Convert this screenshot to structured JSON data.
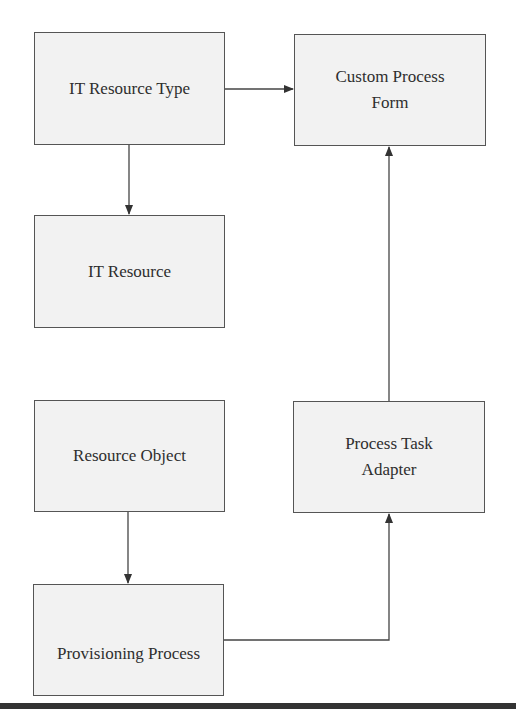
{
  "diagram": {
    "nodes": [
      {
        "id": "it-resource-type",
        "label": "IT Resource Type",
        "x": 34,
        "y": 32,
        "w": 191,
        "h": 113
      },
      {
        "id": "custom-process-form",
        "label": "Custom Process\nForm",
        "x": 294,
        "y": 34,
        "w": 192,
        "h": 112
      },
      {
        "id": "it-resource",
        "label": "IT Resource",
        "x": 34,
        "y": 215,
        "w": 191,
        "h": 113
      },
      {
        "id": "resource-object",
        "label": "Resource Object",
        "x": 34,
        "y": 400,
        "w": 191,
        "h": 112
      },
      {
        "id": "process-task-adapter",
        "label": "Process Task\nAdapter",
        "x": 293,
        "y": 401,
        "w": 192,
        "h": 112
      },
      {
        "id": "provisioning-process",
        "label": "Provisioning Process",
        "x": 33,
        "y": 584,
        "w": 191,
        "h": 112
      }
    ],
    "edges": [
      {
        "from": "it-resource-type",
        "to": "custom-process-form"
      },
      {
        "from": "it-resource-type",
        "to": "it-resource"
      },
      {
        "from": "resource-object",
        "to": "provisioning-process"
      },
      {
        "from": "provisioning-process",
        "to": "process-task-adapter"
      },
      {
        "from": "process-task-adapter",
        "to": "custom-process-form"
      }
    ],
    "colors": {
      "box_fill": "#f2f2f2",
      "box_border": "#555555",
      "line": "#444444",
      "text": "#2e2e2e",
      "bottom_rule": "#333333"
    }
  }
}
